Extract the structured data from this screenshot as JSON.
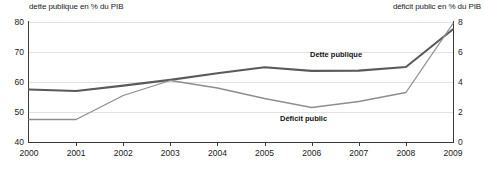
{
  "chart_data": {
    "type": "line",
    "title": "",
    "x": [
      2000,
      2001,
      2002,
      2003,
      2004,
      2005,
      2006,
      2007,
      2008,
      2009
    ],
    "categories": [
      "2000",
      "2001",
      "2002",
      "2003",
      "2004",
      "2005",
      "2006",
      "2007",
      "2008",
      "2009"
    ],
    "series": [
      {
        "name": "Dette publique",
        "axis": "left",
        "color": "#5a5a5a",
        "values": [
          57.5,
          57.0,
          58.8,
          60.7,
          62.9,
          64.9,
          63.7,
          63.8,
          65.0,
          77.6
        ]
      },
      {
        "name": "Déficit public",
        "axis": "right",
        "color": "#8e8e8e",
        "values": [
          1.5,
          1.5,
          3.1,
          4.1,
          3.6,
          2.9,
          2.3,
          2.7,
          3.3,
          7.9
        ]
      }
    ],
    "left_axis": {
      "label": "dette publique en % du PIB",
      "ticks": [
        "40",
        "50",
        "60",
        "70",
        "80"
      ],
      "tick_values": [
        40,
        50,
        60,
        70,
        80
      ],
      "ylim": [
        40,
        80
      ]
    },
    "right_axis": {
      "label": "déficit public en % du PIB",
      "ticks": [
        "0",
        "2",
        "4",
        "6",
        "8"
      ],
      "tick_values": [
        0,
        2,
        4,
        6,
        8
      ],
      "ylim": [
        0,
        8
      ]
    },
    "xlabel": "",
    "grid": true,
    "legend": "inline-annotations",
    "annotations": [
      {
        "text": "Dette publique",
        "series": "Dette publique"
      },
      {
        "text": "Déficit public",
        "series": "Déficit public"
      }
    ]
  },
  "titles": {
    "left": "dette publique en % du PIB",
    "right": "déficit public en % du PIB"
  },
  "labels": {
    "dette": "Dette publique",
    "deficit": "Déficit public"
  },
  "colors": {
    "dette": "#5a5a5a",
    "deficit": "#8e8e8e",
    "axis": "#3a3a3a",
    "grid": "#e2e2e2",
    "text": "#1a1a1a"
  }
}
